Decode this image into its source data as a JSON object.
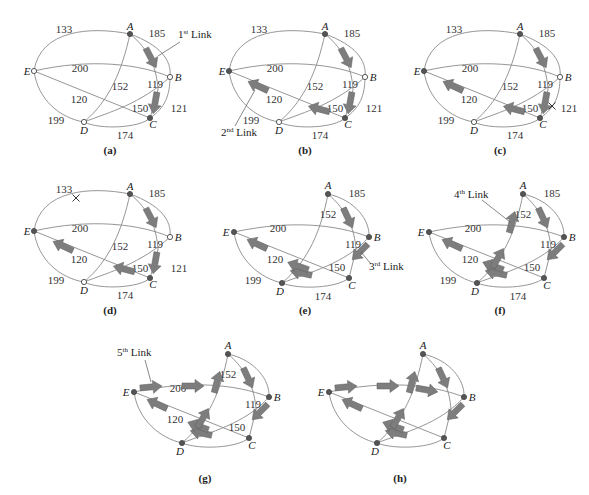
{
  "figure": {
    "panels": [
      {
        "id": "a",
        "caption": "(a)",
        "callout": "1st Link",
        "callout_sup": "st",
        "callout_num": "1",
        "callout_text": " Link"
      },
      {
        "id": "b",
        "caption": "(b)",
        "callout": "2nd Link",
        "callout_sup": "nd",
        "callout_num": "2",
        "callout_text": " Link"
      },
      {
        "id": "c",
        "caption": "(c)"
      },
      {
        "id": "d",
        "caption": "(d)"
      },
      {
        "id": "e",
        "caption": "(e)",
        "callout": "3rd Link",
        "callout_sup": "rd",
        "callout_num": "3",
        "callout_text": " Link"
      },
      {
        "id": "f",
        "caption": "(f)",
        "callout": "4th Link",
        "callout_sup": "th",
        "callout_num": "4",
        "callout_text": " Link"
      },
      {
        "id": "g",
        "caption": "(g)",
        "callout": "5th Link",
        "callout_sup": "th",
        "callout_num": "5",
        "callout_text": " Link"
      },
      {
        "id": "h",
        "caption": "(h)"
      }
    ],
    "nodes": [
      "A",
      "B",
      "C",
      "D",
      "E"
    ],
    "edge_weights": {
      "EA": "133",
      "AB": "185",
      "EB": "200",
      "AD": "152",
      "AC": "119",
      "EC": "120",
      "BC": "121",
      "DB": "150",
      "ED": "199",
      "DC": "174"
    },
    "links_order": [
      {
        "order": 1,
        "label": "1st Link"
      },
      {
        "order": 2,
        "label": "2nd Link"
      },
      {
        "order": 3,
        "label": "3rd Link"
      },
      {
        "order": 4,
        "label": "4th Link"
      },
      {
        "order": 5,
        "label": "5th Link"
      }
    ],
    "colors": {
      "edge": "#8a8a8a",
      "arrow": "#7d7d7d",
      "node_filled": "#555555",
      "node_hollow": "#ffffff",
      "text": "#222222"
    }
  }
}
